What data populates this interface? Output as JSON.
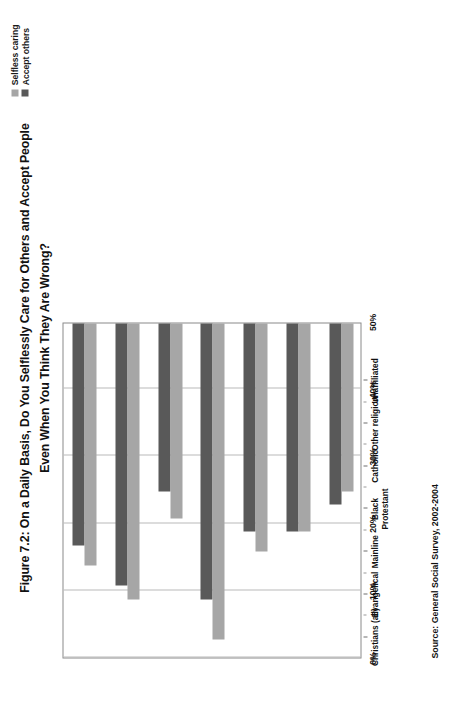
{
  "figure": {
    "title_line1": "Figure 7.2: On a Daily Basis, Do You Selflessly Care for Others and Accept People",
    "title_line2": "Even When You Think They Are Wrong?",
    "source": "Source: General Social Survey, 2002-2004"
  },
  "legend": {
    "items": [
      {
        "label": "Selfless caring",
        "color": "#a6a6a6"
      },
      {
        "label": "Accept others",
        "color": "#595959"
      }
    ]
  },
  "axis": {
    "value_ticks": [
      "50%",
      "40%",
      "30%",
      "20%",
      "10%",
      "0%"
    ],
    "value_tick_numbers": [
      50,
      40,
      30,
      20,
      10,
      0
    ]
  },
  "chart_data": {
    "type": "bar",
    "orientation": "horizontal",
    "title": "Figure 7.2: On a Daily Basis, Do You Selflessly Care for Others and Accept People Even When You Think They Are Wrong?",
    "subtitle": "",
    "xlabel": "",
    "ylabel": "",
    "xlim": [
      0,
      50
    ],
    "xticks": [
      0,
      10,
      20,
      30,
      40,
      50
    ],
    "xticklabels": [
      "0%",
      "10%",
      "20%",
      "30%",
      "40%",
      "50%"
    ],
    "grid": true,
    "legend_position": "top-right",
    "units": "percent",
    "categories": [
      "Christians (all)",
      "Evangelical",
      "Mainline",
      "Black Protestant",
      "Catholic",
      "Other religion",
      "Unaffiliated"
    ],
    "category_lines": [
      [
        "Christians (all)"
      ],
      [
        "Evangelical"
      ],
      [
        "Mainline"
      ],
      [
        "Black",
        "Protestant"
      ],
      [
        "Catholic"
      ],
      [
        "Other religion"
      ],
      [
        "Unaffiliated"
      ]
    ],
    "series": [
      {
        "name": "Selfless caring",
        "color": "#a6a6a6",
        "values": [
          36,
          41,
          29,
          47,
          34,
          31,
          25
        ]
      },
      {
        "name": "Accept others",
        "color": "#595959",
        "values": [
          33,
          39,
          25,
          41,
          31,
          31,
          27
        ]
      }
    ],
    "source": "Source: General Social Survey, 2002-2004"
  }
}
